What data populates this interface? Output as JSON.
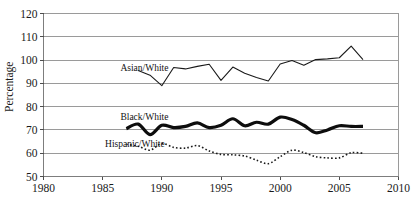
{
  "chart_data": {
    "type": "line",
    "title": "",
    "subtitle": "",
    "xlabel": "",
    "ylabel": "Percentage",
    "xlim": [
      1980,
      2010
    ],
    "ylim": [
      50,
      120
    ],
    "xticks": [
      1980,
      1985,
      1990,
      1995,
      2000,
      2005,
      2010
    ],
    "yticks": [
      50,
      60,
      70,
      80,
      90,
      100,
      110,
      120
    ],
    "grid": true,
    "legend_position": "inline-annotations",
    "series": [
      {
        "name": "Asian/White",
        "style": "thin-solid",
        "color": "#1a1a1a",
        "label_x": 1986.5,
        "label_y": 96.5,
        "x": [
          1988,
          1989,
          1990,
          1991,
          1992,
          1993,
          1994,
          1995,
          1996,
          1997,
          1998,
          1999,
          2000,
          2001,
          2002,
          2003,
          2004,
          2005,
          2006,
          2007
        ],
        "values": [
          95.5,
          93.5,
          89.0,
          96.8,
          96.2,
          97.3,
          98.2,
          91.3,
          97.0,
          94.3,
          92.5,
          91.0,
          98.3,
          99.8,
          97.8,
          100.2,
          100.5,
          101.0,
          106.0,
          100.2
        ]
      },
      {
        "name": "Black/White",
        "style": "thick-solid",
        "color": "#0d0d0d",
        "label_x": 1986.5,
        "label_y": 75.5,
        "x": [
          1987,
          1988,
          1989,
          1990,
          1991,
          1992,
          1993,
          1994,
          1995,
          1996,
          1997,
          1998,
          1999,
          2000,
          2001,
          2002,
          2003,
          2004,
          2005,
          2006,
          2007
        ],
        "values": [
          70.5,
          72.5,
          68.0,
          72.0,
          71.0,
          71.5,
          73.0,
          71.0,
          72.0,
          74.8,
          71.8,
          73.3,
          72.5,
          75.5,
          74.5,
          72.0,
          68.8,
          70.0,
          71.8,
          71.5,
          71.5
        ]
      },
      {
        "name": "Hispanic/White",
        "style": "dotted",
        "color": "#1a1a1a",
        "label_x": 1985.2,
        "label_y": 64.0,
        "x": [
          1987,
          1988,
          1989,
          1990,
          1991,
          1992,
          1993,
          1994,
          1995,
          1996,
          1997,
          1998,
          1999,
          2000,
          2001,
          2002,
          2003,
          2004,
          2005,
          2006,
          2007
        ],
        "values": [
          63.8,
          63.0,
          61.3,
          64.2,
          62.5,
          62.2,
          63.3,
          61.0,
          59.5,
          59.3,
          58.8,
          57.0,
          55.5,
          58.5,
          61.3,
          60.3,
          58.5,
          58.0,
          58.0,
          60.2,
          60.0
        ]
      }
    ]
  },
  "axis": {
    "y_title": "Percentage",
    "y_tick_labels": [
      "120",
      "110",
      "100",
      "90",
      "80",
      "70",
      "60",
      "50"
    ],
    "x_tick_labels": [
      "1980",
      "1985",
      "1990",
      "1995",
      "2000",
      "2005",
      "2010"
    ]
  },
  "labels": {
    "asian_white": "Asian/White",
    "black_white": "Black/White",
    "hispanic_white": "Hispanic/White"
  }
}
